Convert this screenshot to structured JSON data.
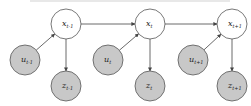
{
  "diagram": {
    "type": "graphical-model",
    "colors": {
      "hidden_fill": "#ffffff",
      "observed_fill": "#c8c8c8",
      "stroke": "#555555",
      "edge": "#444444"
    },
    "nodes": [
      {
        "id": "x_prev",
        "base": "x",
        "sub": "t-1",
        "cx": 66,
        "cy": 24,
        "kind": "hidden"
      },
      {
        "id": "x_t",
        "base": "x",
        "sub": "t",
        "cx": 150,
        "cy": 24,
        "kind": "hidden"
      },
      {
        "id": "x_next",
        "base": "x",
        "sub": "t+1",
        "cx": 232,
        "cy": 24,
        "kind": "hidden"
      },
      {
        "id": "u_prev",
        "base": "u",
        "sub": "t-1",
        "cx": 25,
        "cy": 60,
        "kind": "observed"
      },
      {
        "id": "u_t",
        "base": "u",
        "sub": "t",
        "cx": 108,
        "cy": 60,
        "kind": "observed"
      },
      {
        "id": "u_next",
        "base": "u",
        "sub": "t+1",
        "cx": 193,
        "cy": 60,
        "kind": "observed"
      },
      {
        "id": "z_prev",
        "base": "z",
        "sub": "t-1",
        "cx": 66,
        "cy": 86,
        "kind": "observed"
      },
      {
        "id": "z_t",
        "base": "z",
        "sub": "t",
        "cx": 150,
        "cy": 86,
        "kind": "observed"
      },
      {
        "id": "z_next",
        "base": "z",
        "sub": "t+1",
        "cx": 232,
        "cy": 86,
        "kind": "observed"
      }
    ],
    "edges": [
      [
        "x_prev",
        "x_t"
      ],
      [
        "x_t",
        "x_next"
      ],
      [
        "u_prev",
        "x_prev"
      ],
      [
        "u_t",
        "x_t"
      ],
      [
        "u_next",
        "x_next"
      ],
      [
        "x_prev",
        "z_prev"
      ],
      [
        "x_t",
        "z_t"
      ],
      [
        "x_next",
        "z_next"
      ]
    ]
  }
}
